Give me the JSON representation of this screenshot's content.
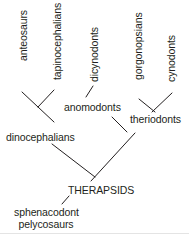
{
  "diagram": {
    "type": "cladogram",
    "root": "THERAPSIDS",
    "outgroup": "sphenacodont pelycosaurs",
    "terminal_taxa": [
      {
        "name": "anteosaurs"
      },
      {
        "name": "tapinocephalians"
      },
      {
        "name": "dicynodonts"
      },
      {
        "name": "gorgonopsians"
      },
      {
        "name": "cynodonts"
      }
    ],
    "internal_nodes": [
      {
        "name": "dinocephalians",
        "children": [
          "anteosaurs",
          "tapinocephalians"
        ]
      },
      {
        "name": "anomodonts",
        "children": [
          "dicynodonts"
        ]
      },
      {
        "name": "theriodonts",
        "children": [
          "gorgonopsians",
          "cynodonts"
        ]
      },
      {
        "name": "THERAPSIDS",
        "children": [
          "dinocephalians",
          "anomodonts",
          "theriodonts"
        ]
      }
    ],
    "labels": {
      "anteosaurs": "anteosaurs",
      "tapinocephalians": "tapinocephalians",
      "dicynodonts": "dicynodonts",
      "gorgonopsians": "gorgonopsians",
      "cynodonts": "cynodonts",
      "anomodonts": "anomodonts",
      "theriodonts": "theriodonts",
      "dinocephalians": "dinocephalians",
      "therapsids": "THERAPSIDS",
      "outgroup_line1": "sphenacodont",
      "outgroup_line2": "pelycosaurs"
    },
    "colors": {
      "line": "#231f20",
      "text": "#231f20",
      "background": "#ffffff"
    }
  }
}
